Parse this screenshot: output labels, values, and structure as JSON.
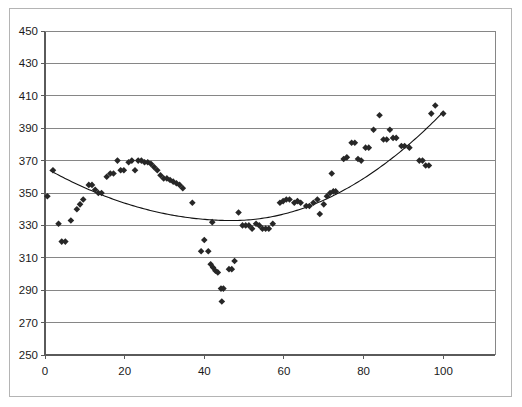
{
  "chart_data": {
    "type": "scatter",
    "title": "",
    "xlabel": "",
    "ylabel": "",
    "xlim": [
      0,
      113
    ],
    "ylim": [
      250,
      450
    ],
    "grid": true,
    "legend": null,
    "x_ticks": [
      0,
      20,
      40,
      60,
      80,
      100
    ],
    "y_ticks": [
      250,
      270,
      290,
      310,
      330,
      350,
      370,
      390,
      410,
      430,
      450
    ],
    "x_tick_labels": [
      "0",
      "20",
      "40",
      "60",
      "80",
      "100"
    ],
    "y_tick_labels": [
      "250",
      "270",
      "290",
      "310",
      "330",
      "350",
      "370",
      "390",
      "410",
      "430",
      "450"
    ],
    "series": [
      {
        "name": "observations",
        "marker": "diamond",
        "color": "#272727",
        "points": [
          [
            0.6,
            348
          ],
          [
            2.0,
            364
          ],
          [
            3.4,
            331
          ],
          [
            4.2,
            320
          ],
          [
            5.1,
            320
          ],
          [
            6.5,
            333
          ],
          [
            8.0,
            340
          ],
          [
            8.8,
            343
          ],
          [
            9.6,
            346
          ],
          [
            11.0,
            355
          ],
          [
            11.8,
            355
          ],
          [
            12.6,
            352
          ],
          [
            13.4,
            350
          ],
          [
            14.2,
            350
          ],
          [
            15.5,
            360
          ],
          [
            16.4,
            362
          ],
          [
            17.2,
            362
          ],
          [
            18.2,
            370
          ],
          [
            19.0,
            364
          ],
          [
            19.8,
            364
          ],
          [
            21.0,
            369
          ],
          [
            21.8,
            370
          ],
          [
            22.6,
            364
          ],
          [
            23.4,
            370
          ],
          [
            24.2,
            370
          ],
          [
            25.0,
            369
          ],
          [
            25.8,
            369
          ],
          [
            26.6,
            368
          ],
          [
            27.4,
            366
          ],
          [
            28.2,
            364
          ],
          [
            29.0,
            361
          ],
          [
            29.8,
            359
          ],
          [
            30.6,
            359
          ],
          [
            31.4,
            358
          ],
          [
            32.2,
            357
          ],
          [
            33.0,
            356
          ],
          [
            33.8,
            355
          ],
          [
            34.6,
            353
          ],
          [
            37.0,
            344
          ],
          [
            40.0,
            321
          ],
          [
            39.2,
            314
          ],
          [
            41.0,
            314
          ],
          [
            41.6,
            306
          ],
          [
            42.2,
            304
          ],
          [
            42.8,
            302
          ],
          [
            43.4,
            301
          ],
          [
            44.2,
            291
          ],
          [
            44.8,
            291
          ],
          [
            44.4,
            283
          ],
          [
            46.2,
            303
          ],
          [
            46.9,
            303
          ],
          [
            47.6,
            308
          ],
          [
            42.0,
            332
          ],
          [
            48.6,
            338
          ],
          [
            49.6,
            330
          ],
          [
            50.4,
            330
          ],
          [
            51.2,
            330
          ],
          [
            52.0,
            328
          ],
          [
            53.0,
            331
          ],
          [
            53.8,
            330
          ],
          [
            54.6,
            328
          ],
          [
            55.4,
            328
          ],
          [
            56.2,
            328
          ],
          [
            57.2,
            331
          ],
          [
            59.0,
            344
          ],
          [
            59.8,
            345
          ],
          [
            60.6,
            346
          ],
          [
            61.4,
            346
          ],
          [
            62.6,
            344
          ],
          [
            63.4,
            345
          ],
          [
            64.2,
            344
          ],
          [
            65.6,
            342
          ],
          [
            66.4,
            342
          ],
          [
            67.4,
            344
          ],
          [
            68.4,
            346
          ],
          [
            69.0,
            337
          ],
          [
            70.0,
            343
          ],
          [
            70.8,
            348
          ],
          [
            71.6,
            350
          ],
          [
            72.4,
            351
          ],
          [
            73.0,
            351
          ],
          [
            72.0,
            362
          ],
          [
            75.0,
            371
          ],
          [
            75.8,
            372
          ],
          [
            77.0,
            381
          ],
          [
            77.8,
            381
          ],
          [
            78.6,
            371
          ],
          [
            79.4,
            370
          ],
          [
            80.5,
            378
          ],
          [
            81.3,
            378
          ],
          [
            82.5,
            389
          ],
          [
            84.0,
            398
          ],
          [
            85.0,
            383
          ],
          [
            85.8,
            383
          ],
          [
            86.6,
            389
          ],
          [
            87.4,
            384
          ],
          [
            88.2,
            384
          ],
          [
            89.5,
            379
          ],
          [
            90.3,
            379
          ],
          [
            91.5,
            378
          ],
          [
            94.0,
            370
          ],
          [
            94.8,
            370
          ],
          [
            95.6,
            367
          ],
          [
            96.4,
            367
          ],
          [
            97.0,
            399
          ],
          [
            98.0,
            404
          ],
          [
            100.0,
            399
          ]
        ]
      }
    ],
    "trendline": {
      "type": "quadratic",
      "label": "",
      "color": "#111111",
      "vertex_x": 47,
      "vertex_y": 333,
      "start_x": 1.2,
      "start_y": 364,
      "end_x": 100,
      "end_y": 400
    }
  }
}
